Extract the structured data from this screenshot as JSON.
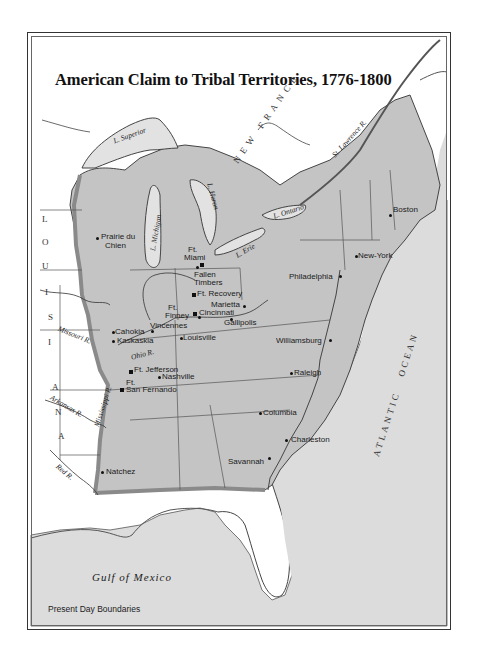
{
  "map": {
    "title": "American Claim to Tribal Territories, 1776-1800",
    "legend": "Present Day Boundaries",
    "colors": {
      "paper": "#ffffff",
      "ocean": "#dcdcdc",
      "claimed_territory": "#c4c4c4",
      "claim_boundary": "#8a8a8a",
      "unclaimed_land": "#ffffff",
      "lines": "#333333"
    },
    "regions": {
      "louisiana": [
        "L",
        "O",
        "U",
        "I",
        "S",
        "I",
        "A",
        "N",
        "A"
      ],
      "new_france": "NEW FRANCE",
      "atlantic": "ATLANTIC",
      "ocean": "OCEAN",
      "gulf": "Gulf of Mexico"
    },
    "water": {
      "superior": "L. Superior",
      "michigan": "L. Michigan",
      "huron": "L. Huron",
      "erie": "L. Erie",
      "ontario": "L. Ontario",
      "st_lawrence": "St. Lawrence R.",
      "missouri": "Missouri R.",
      "mississippi": "Mississippi R.",
      "ohio": "Ohio R.",
      "arkansas": "Arkansas R.",
      "red": "Red R."
    },
    "places": {
      "prairie_du_chien": [
        "Prairie du",
        "Chien"
      ],
      "ft_miami": [
        "Ft.",
        "Miami"
      ],
      "fallen_timbers": [
        "Fallen",
        "Timbers"
      ],
      "ft_recovery": "Ft. Recovery",
      "ft_finney": [
        "Ft.",
        "Finney"
      ],
      "cincinnati": "Cincinnati",
      "marietta": "Marietta",
      "gallipolis": "Gallipolis",
      "vincennes": "Vincennes",
      "cahokia": "Cahokia",
      "kaskaskia": "Kaskaskia",
      "louisville": "Louisville",
      "ft_jefferson": "Ft. Jefferson",
      "nashville": "Nashville",
      "ft_san_fernando": [
        "Ft.",
        "San Fernando"
      ],
      "natchez": "Natchez",
      "boston": "Boston",
      "new_york": "New-York",
      "philadelphia": "Philadelphia",
      "williamsburg": "Williamsburg",
      "raleigh": "Raleigh",
      "columbia": "Columbia",
      "charleston": "Charleston",
      "savannah": "Savannah"
    }
  }
}
